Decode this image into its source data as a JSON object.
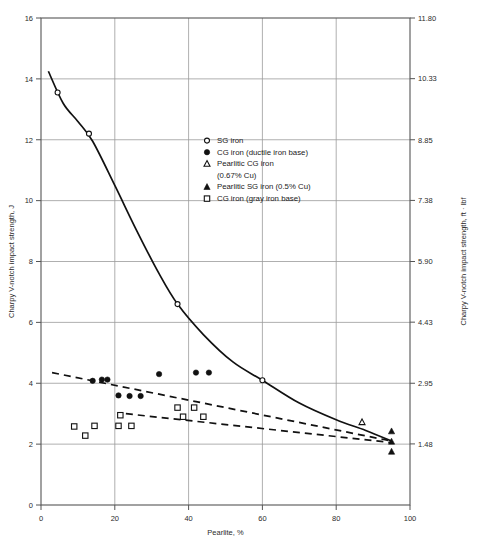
{
  "chart_data": {
    "type": "scatter",
    "title": "",
    "xlabel": "Pearlite, %",
    "ylabel": "Charpy V-notch impact strength, J",
    "ylabel_right": "Charpy V-notch impact strength, ft · lbf",
    "xlim": [
      0,
      100
    ],
    "ylim": [
      0,
      16
    ],
    "ylim_right": [
      0,
      11.8
    ],
    "grid": true,
    "legend_position": "upper-right-inside",
    "xticks": [
      0,
      20,
      40,
      60,
      80,
      100
    ],
    "xtick_labels": [
      "0",
      "20",
      "40",
      "60",
      "80",
      "100"
    ],
    "yticks": [
      0,
      2,
      4,
      6,
      8,
      10,
      12,
      14,
      16
    ],
    "ytick_labels": [
      "0",
      "2",
      "4",
      "6",
      "8",
      "10",
      "12",
      "14",
      "16"
    ],
    "yticks_right": [
      1.48,
      2.95,
      4.43,
      5.9,
      7.38,
      8.85,
      10.33,
      11.8
    ],
    "ytick_labels_right": [
      "1.48",
      "2.95",
      "4.43",
      "5.90",
      "7.38",
      "8.85",
      "10.33",
      "11.80"
    ],
    "series": [
      {
        "name": "SG iron",
        "marker": "open-circle",
        "points": [
          [
            4.5,
            13.55
          ],
          [
            13.0,
            12.2
          ],
          [
            37.0,
            6.6
          ],
          [
            60.0,
            4.1
          ]
        ]
      },
      {
        "name": "CG iron (ductile iron base)",
        "marker": "filled-circle",
        "points": [
          [
            14.0,
            4.08
          ],
          [
            16.5,
            4.12
          ],
          [
            18.0,
            4.12
          ],
          [
            21.0,
            3.6
          ],
          [
            24.0,
            3.58
          ],
          [
            27.0,
            3.58
          ],
          [
            32.0,
            4.3
          ],
          [
            42.0,
            4.35
          ],
          [
            45.5,
            4.35
          ]
        ]
      },
      {
        "name": "Pearlitic CG iron (0.67% Cu)",
        "marker": "open-triangle",
        "points": [
          [
            87.0,
            2.72
          ]
        ]
      },
      {
        "name": "Pearlitic SG iron (0.5% Cu)",
        "marker": "filled-triangle",
        "points": [
          [
            95.0,
            2.42
          ],
          [
            95.0,
            2.08
          ],
          [
            95.0,
            1.75
          ]
        ]
      },
      {
        "name": "CG iron (gray iron base)",
        "marker": "open-square",
        "points": [
          [
            9.0,
            2.58
          ],
          [
            12.0,
            2.28
          ],
          [
            14.5,
            2.6
          ],
          [
            21.0,
            2.6
          ],
          [
            21.5,
            2.95
          ],
          [
            24.5,
            2.6
          ],
          [
            37.0,
            3.2
          ],
          [
            41.5,
            3.2
          ],
          [
            38.5,
            2.9
          ],
          [
            44.0,
            2.9
          ]
        ]
      }
    ],
    "curves": [
      {
        "name": "sg-iron-trend",
        "style": "solid",
        "points": [
          [
            2.0,
            14.25
          ],
          [
            6.0,
            13.2
          ],
          [
            10.0,
            12.6
          ],
          [
            14.0,
            11.95
          ],
          [
            20.0,
            10.5
          ],
          [
            26.0,
            9.0
          ],
          [
            32.0,
            7.6
          ],
          [
            37.0,
            6.6
          ],
          [
            44.0,
            5.6
          ],
          [
            52.0,
            4.7
          ],
          [
            60.0,
            4.1
          ],
          [
            70.0,
            3.35
          ],
          [
            80.0,
            2.8
          ],
          [
            88.0,
            2.45
          ],
          [
            95.0,
            2.1
          ]
        ]
      },
      {
        "name": "cg-iron-ductile-trend",
        "style": "dashed",
        "points": [
          [
            3.0,
            4.35
          ],
          [
            95.0,
            2.1
          ]
        ]
      },
      {
        "name": "cg-iron-gray-trend",
        "style": "dashed",
        "points": [
          [
            23.0,
            3.0
          ],
          [
            95.0,
            2.05
          ]
        ]
      }
    ],
    "legend": [
      {
        "marker": "open-circle",
        "label": "SG iron"
      },
      {
        "marker": "filled-circle",
        "label": "CG iron (ductile iron base)"
      },
      {
        "marker": "open-triangle",
        "label": "Pearlitic CG iron"
      },
      {
        "marker": "none",
        "label": "(0.67% Cu)"
      },
      {
        "marker": "filled-triangle",
        "label": "Pearlitic SG iron (0.5% Cu)"
      },
      {
        "marker": "open-square",
        "label": "CG iron (gray iron base)"
      }
    ],
    "colors": {
      "line": "#111111",
      "grid": "#9a9a9a",
      "axis": "#555555",
      "marker": "#111111",
      "background": "#ffffff"
    }
  }
}
